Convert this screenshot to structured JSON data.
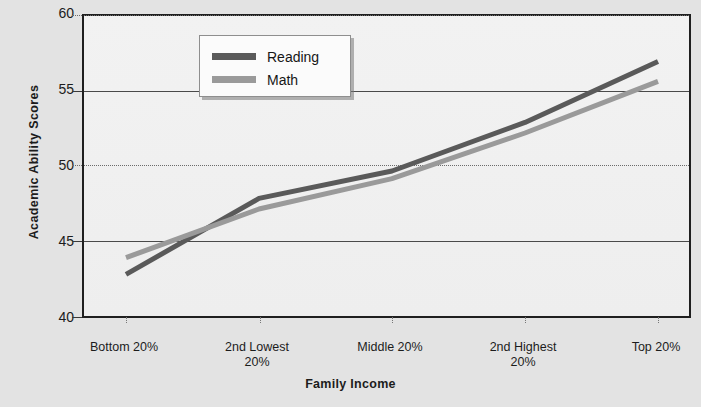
{
  "axes": {
    "y_title": "Academic  Ability  Scores",
    "x_title": "Family Income",
    "y_ticks": [
      "60",
      "55",
      "50",
      "45",
      "40"
    ],
    "x_ticks": [
      "Bottom 20%",
      "2nd Lowest\n20%",
      "Middle 20%",
      "2nd Highest\n20%",
      "Top 20%"
    ]
  },
  "legend": {
    "position": "top-left",
    "entries": [
      {
        "label": "Reading",
        "color": "#5a5a5a"
      },
      {
        "label": "Math",
        "color": "#9a9a9a"
      }
    ]
  },
  "colors": {
    "reading": "#5a5a5a",
    "math": "#9a9a9a",
    "axis": "#1f1f1f",
    "grid": "#4a4a4a",
    "background": "#e3e3e3",
    "plot_background": "#f0f0f0"
  },
  "chart_data": {
    "type": "line",
    "title": "",
    "subtitle": "",
    "xlabel": "Family Income",
    "ylabel": "Academic Ability Scores",
    "categories": [
      "Bottom 20%",
      "2nd Lowest 20%",
      "Middle 20%",
      "2nd Highest 20%",
      "Top 20%"
    ],
    "series": [
      {
        "name": "Reading",
        "color": "#5a5a5a",
        "values": [
          43.0,
          48.0,
          49.8,
          53.0,
          57.0
        ]
      },
      {
        "name": "Math",
        "color": "#9a9a9a",
        "values": [
          44.1,
          47.3,
          49.3,
          52.3,
          55.7
        ]
      }
    ],
    "ylim": [
      40,
      60
    ],
    "yticks": [
      40,
      45,
      50,
      55,
      60
    ],
    "grid": true,
    "legend_position": "top-left",
    "annotations": []
  }
}
